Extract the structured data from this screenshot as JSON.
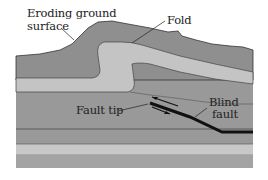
{
  "labels": {
    "eroding_surface_line1": "Eroding ground",
    "eroding_surface_line2": "surface",
    "fold": "Fold",
    "fault_tip": "Fault tip",
    "blind_fault_line1": "Blind",
    "blind_fault_line2": "fault"
  },
  "colors": {
    "background": "#ffffff",
    "upper_layer": "#8f8f8f",
    "fold_layer": "#c4c4c4",
    "middle_layer": "#999999",
    "lower_light_layer": "#c8c8c8",
    "bottom_layer": "#a3a3a3",
    "fault_line": "#111111",
    "contact_line": "#444444"
  }
}
